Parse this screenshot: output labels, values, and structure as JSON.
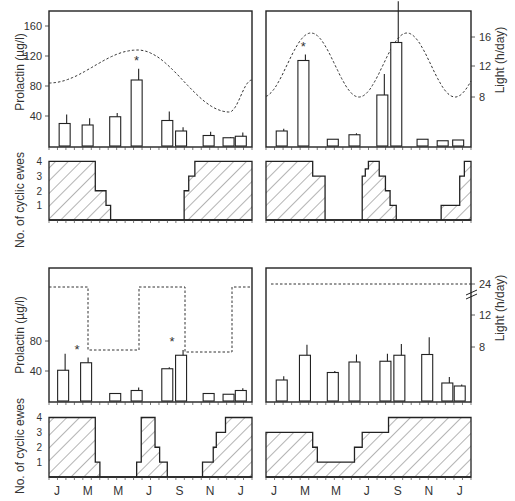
{
  "figure": {
    "left_axis_label_top": "Prolactin (µg/l)",
    "left_axis_label_bottom": "No. of cyclic ewes",
    "right_axis_label": "Light (h/day)",
    "months": [
      "J",
      "M",
      "M",
      "J",
      "S",
      "N",
      "J"
    ]
  },
  "chart_data": [
    {
      "type": "bar",
      "panel": "top-left",
      "title": "",
      "ylabel": "Prolactin (µg/l)",
      "y2label": "",
      "yticks": [
        40,
        80,
        120,
        160
      ],
      "ylim": [
        0,
        178
      ],
      "bar_x_month_index": [
        0.25,
        1.0,
        1.9,
        2.6,
        3.6,
        4.05,
        4.95,
        5.6,
        6.0
      ],
      "values": [
        30,
        28,
        39,
        88,
        34,
        20,
        14,
        11,
        13
      ],
      "errors": [
        12,
        9,
        5,
        15,
        12,
        5,
        5,
        1,
        5
      ],
      "significant": [
        false,
        false,
        false,
        true,
        false,
        false,
        false,
        false,
        false
      ],
      "light_curve": {
        "type": "sinusoid",
        "min_h": 8,
        "max_h": 16,
        "peak_month_index": 2.75,
        "trough_month_index": 5.6
      },
      "light_curve_prolactin_scale": {
        "at_start": 73,
        "peak": 152,
        "trough": 68,
        "at_end": 85
      }
    },
    {
      "type": "bar",
      "panel": "top-right",
      "ylabel": "",
      "y2label": "Light (h/day)",
      "y2ticks": [
        8,
        12,
        16
      ],
      "ylim": [
        0,
        178
      ],
      "bar_x_month_index": [
        0.25,
        0.95,
        1.9,
        2.6,
        3.5,
        3.95,
        4.8,
        5.45,
        5.95
      ],
      "values": [
        20,
        114,
        9,
        15,
        68,
        138,
        9,
        7,
        8
      ],
      "errors": [
        3,
        8,
        0,
        2,
        28,
        55,
        0,
        0,
        0
      ],
      "significant": [
        false,
        true,
        false,
        false,
        false,
        true,
        false,
        false,
        false
      ],
      "light_curve": {
        "type": "sinusoid-semiannual",
        "min_h": 8,
        "max_h": 16,
        "peaks_month_index": [
          1.15,
          4.0
        ],
        "troughs_month_index": [
          2.65,
          5.5
        ]
      }
    },
    {
      "type": "bar",
      "panel": "bottom-left",
      "ylabel": "Prolactin (µg/l)",
      "yticks": [
        40,
        80
      ],
      "ylim": [
        0,
        178
      ],
      "bar_x_month_index": [
        0.2,
        0.95,
        1.9,
        2.6,
        3.6,
        4.05,
        4.95,
        5.6,
        6.0
      ],
      "values": [
        41,
        51,
        10,
        14,
        43,
        61,
        10,
        9,
        14
      ],
      "errors": [
        22,
        7,
        0,
        4,
        2,
        7,
        0,
        0,
        3
      ],
      "significant": [
        false,
        true,
        false,
        false,
        false,
        true,
        false,
        false,
        false
      ],
      "light_curve": {
        "type": "square-wave",
        "high_h": 16,
        "low_h": 8,
        "transitions_month_index": [
          1.2,
          2.75,
          4.1,
          5.55
        ]
      }
    },
    {
      "type": "bar",
      "panel": "bottom-right",
      "y2label": "Light (h/day)",
      "y2ticks": [
        8,
        12,
        24
      ],
      "axis_break": true,
      "ylim": [
        0,
        178
      ],
      "bar_x_month_index": [
        0.25,
        1.0,
        1.9,
        2.6,
        3.6,
        4.05,
        4.95,
        5.6,
        6.0
      ],
      "values": [
        28,
        61,
        38,
        52,
        53,
        61,
        62,
        24,
        20
      ],
      "errors": [
        5,
        14,
        2,
        10,
        10,
        15,
        23,
        8,
        2
      ],
      "significant": [
        false,
        false,
        false,
        false,
        false,
        false,
        false,
        false,
        false
      ],
      "light_curve": {
        "type": "constant",
        "value_h": 24
      }
    },
    {
      "type": "area",
      "panel": "cyclic-top-left",
      "ylabel": "No. of cyclic ewes",
      "yticks": [
        1,
        2,
        3,
        4
      ],
      "ylim": [
        0,
        4
      ],
      "steps": [
        [
          0,
          4
        ],
        [
          1.25,
          2
        ],
        [
          1.6,
          1
        ],
        [
          1.75,
          0
        ],
        [
          4.15,
          2
        ],
        [
          4.3,
          3
        ],
        [
          4.5,
          4
        ],
        [
          6.3,
          4
        ]
      ]
    },
    {
      "type": "area",
      "panel": "cyclic-top-right",
      "ylim": [
        0,
        4
      ],
      "steps": [
        [
          0,
          4
        ],
        [
          1.25,
          3
        ],
        [
          1.65,
          0
        ],
        [
          2.85,
          3
        ],
        [
          2.95,
          3.5
        ],
        [
          3.05,
          4
        ],
        [
          3.4,
          3
        ],
        [
          3.6,
          2
        ],
        [
          3.75,
          1
        ],
        [
          3.95,
          0
        ],
        [
          5.4,
          1
        ],
        [
          6.0,
          3
        ],
        [
          6.15,
          4
        ],
        [
          6.3,
          4
        ]
      ]
    },
    {
      "type": "area",
      "panel": "cyclic-bottom-left",
      "ylabel": "No. of cyclic ewes",
      "yticks": [
        1,
        2,
        3,
        4
      ],
      "ylim": [
        0,
        4
      ],
      "steps": [
        [
          0,
          4
        ],
        [
          1.25,
          1
        ],
        [
          1.4,
          0
        ],
        [
          2.6,
          1
        ],
        [
          2.75,
          4
        ],
        [
          3.2,
          2
        ],
        [
          3.35,
          1
        ],
        [
          3.6,
          0
        ],
        [
          4.75,
          1
        ],
        [
          5.1,
          2
        ],
        [
          5.2,
          3
        ],
        [
          5.5,
          4
        ],
        [
          6.3,
          4
        ]
      ]
    },
    {
      "type": "area",
      "panel": "cyclic-bottom-right",
      "ylim": [
        0,
        4
      ],
      "steps": [
        [
          0,
          3
        ],
        [
          1.25,
          2
        ],
        [
          1.4,
          1
        ],
        [
          2.6,
          2
        ],
        [
          2.85,
          3
        ],
        [
          3.7,
          4
        ],
        [
          6.3,
          4
        ]
      ]
    }
  ]
}
